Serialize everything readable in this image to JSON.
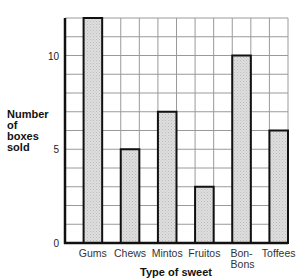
{
  "chart_data": {
    "type": "bar",
    "title": "",
    "categories": [
      "Gums",
      "Chews",
      "Mintos",
      "Fruitos",
      "Bon-Bons",
      "Toffees"
    ],
    "category_label_lines": [
      [
        "Gums"
      ],
      [
        "Chews"
      ],
      [
        "Mintos"
      ],
      [
        "Fruitos"
      ],
      [
        "Bon-",
        "Bons"
      ],
      [
        "Toffees"
      ]
    ],
    "values": [
      12,
      5,
      7,
      3,
      10,
      6
    ],
    "xlabel": "Type of sweet",
    "ylabel_lines": [
      "Number",
      "of",
      "boxes",
      "sold"
    ],
    "ylim": [
      0,
      12
    ],
    "yticks": [
      0,
      5,
      10
    ],
    "grid": true,
    "grid_step": 1,
    "colors": {
      "bar_fill": "#d9d9d9",
      "bar_stroke": "#111111",
      "grid": "#9a9a9a",
      "axis": "#111111"
    }
  }
}
